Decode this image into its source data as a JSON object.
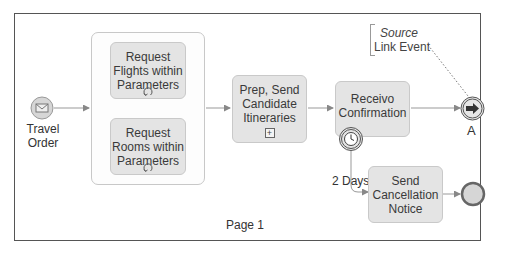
{
  "page": {
    "label": "Page 1"
  },
  "start_event": {
    "label_line1": "Travel",
    "label_line2": "Order",
    "type": "message-start-event"
  },
  "parallel_group": {
    "tasks": [
      {
        "line1": "Request",
        "line2": "Flights within",
        "line3": "Parameters",
        "marker": "loop-icon"
      },
      {
        "line1": "Request",
        "line2": "Rooms within",
        "line3": "Parameters",
        "marker": "loop-icon"
      }
    ]
  },
  "subprocess": {
    "line1": "Prep, Send",
    "line2": "Candidate",
    "line3": "Itineraries",
    "marker": "plus-icon"
  },
  "receive_task": {
    "line1": "Receivo",
    "line2": "Confirmation",
    "boundary_event": "timer-icon"
  },
  "timer_flow": {
    "label": "2 Days"
  },
  "cancel_task": {
    "line1": "Send",
    "line2": "Cancellation",
    "line3": "Notice"
  },
  "link_event": {
    "label": "A",
    "type": "link-throw-event"
  },
  "annotation": {
    "line1": "Source",
    "line2": "Link Event"
  },
  "end_event": {
    "type": "end-event"
  },
  "colors": {
    "task_fill": "#e4e4e4",
    "event_fill": "#d6d6d6",
    "line": "#888888",
    "frame": "#555555"
  }
}
